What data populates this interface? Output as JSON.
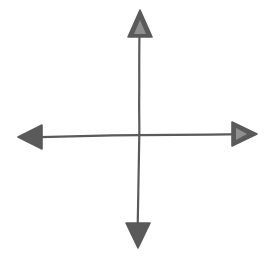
{
  "figure": {
    "background_color": "#ffffff",
    "stroke_color": "#5a5a5a",
    "notch_color": "#8f8f8f",
    "stroke_width": 2.2,
    "canvas": {
      "width": 272,
      "height": 260
    },
    "origin": {
      "x": 139,
      "y": 135,
      "label": "origin"
    },
    "axes": [
      {
        "name": "vertical-axis",
        "orientation": "vertical",
        "path": "M139.6,30 C139.0,52 139.4,74 139.2,96 C139.0,112 139.5,124 139.3,135 C139.1,152 138.6,172 138.3,192 C138.0,210 137.8,222 137.6,232",
        "start": {
          "x": 140,
          "y": 30
        },
        "end": {
          "x": 138,
          "y": 232
        }
      },
      {
        "name": "horizontal-axis",
        "orientation": "horizontal",
        "path": "M30,137.4 C54,136.6 78,136.0 102,135.6 C118,135.3 130,135.2 139,135.2 C162,135.0 186,134.8 210,134.6 C226,134.4 238,134.3 246,134.2",
        "start": {
          "x": 30,
          "y": 137
        },
        "end": {
          "x": 246,
          "y": 134
        }
      }
    ],
    "arrowheads": [
      {
        "name": "arrowhead-up",
        "direction": "up",
        "style": "notched",
        "tip": {
          "x": 140,
          "y": 10
        },
        "points": "140,10 152,37 128,37",
        "notch_points": "140,20 146,34 134,34"
      },
      {
        "name": "arrowhead-right",
        "direction": "right",
        "style": "notched",
        "tip": {
          "x": 257,
          "y": 134
        },
        "points": "257,134 232,146 232,122",
        "notch_points": "247,134 236,140 236,128"
      },
      {
        "name": "arrowhead-down",
        "direction": "down",
        "style": "solid",
        "tip": {
          "x": 138,
          "y": 248
        },
        "points": "138,248 150,223 126,223",
        "notch_points": ""
      },
      {
        "name": "arrowhead-left",
        "direction": "left",
        "style": "solid",
        "tip": {
          "x": 18,
          "y": 137
        },
        "points": "18,137 42,125 42,149",
        "notch_points": ""
      }
    ],
    "labels": {
      "figure_caption": "Coordinate axes",
      "up_label": "up",
      "right_label": "right",
      "down_label": "down",
      "left_label": "left"
    }
  }
}
